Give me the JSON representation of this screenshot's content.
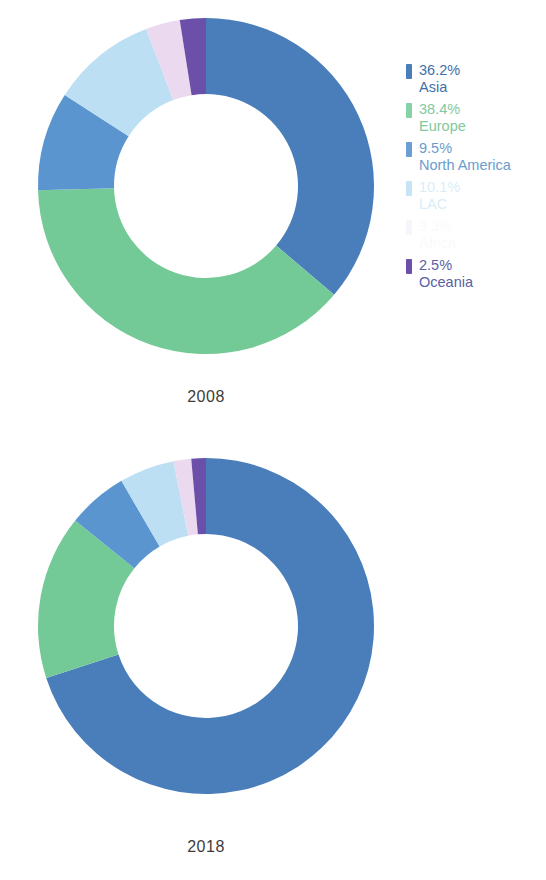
{
  "chart_data": [
    {
      "type": "pie",
      "title": "2008",
      "subtitle": "",
      "xlabel": "",
      "ylabel": "",
      "donut": true,
      "legend_position": "right",
      "grid": false,
      "categories": [
        "Asia",
        "Europe",
        "North America",
        "LAC",
        "Africa",
        "Oceania"
      ],
      "values": [
        36.2,
        38.4,
        9.5,
        10.1,
        3.3,
        2.5
      ],
      "labels": [
        "36.2%",
        "38.4%",
        "9.5%",
        "10.1%",
        "3.3%",
        "2.5%"
      ],
      "colors": [
        "#4a7ebb",
        "#73ca97",
        "#5b95d0",
        "#bcdff4",
        "#ead9ef",
        "#6b4fa8"
      ]
    },
    {
      "type": "pie",
      "title": "2018",
      "subtitle": "",
      "xlabel": "",
      "ylabel": "",
      "donut": true,
      "legend_position": "right",
      "grid": false,
      "categories": [
        "Asia",
        "Europe",
        "North America",
        "LAC",
        "Africa",
        "Oceania"
      ],
      "values": [
        70.0,
        15.8,
        5.8,
        5.3,
        1.7,
        1.4
      ],
      "labels": [
        "70.0%",
        "15.8%",
        "5.8%",
        "5.3%",
        "1.7%",
        "1.4%"
      ],
      "colors": [
        "#4a7ebb",
        "#73ca97",
        "#5b95d0",
        "#bcdff4",
        "#ead9ef",
        "#6b4fa8"
      ]
    }
  ],
  "charts": [
    {
      "year_label": "2008",
      "legend": [
        {
          "pct": "36.2%",
          "name": "Asia",
          "color": "#4a7ebb",
          "text_color": "#3f6fa8",
          "opacity": "1"
        },
        {
          "pct": "38.4%",
          "name": "Europe",
          "color": "#73ca97",
          "text_color": "#6cc08f",
          "opacity": "0.85"
        },
        {
          "pct": "9.5%",
          "name": "North America",
          "color": "#5b95d0",
          "text_color": "#5a93c9",
          "opacity": "0.9"
        },
        {
          "pct": "10.1%",
          "name": "LAC",
          "color": "#7fc5ea",
          "text_color": "#aed8ef",
          "opacity": "0.45"
        },
        {
          "pct": "3.3%",
          "name": "Africa",
          "color": "#d9c9e4",
          "text_color": "#e2e6ea",
          "opacity": "0.18"
        },
        {
          "pct": "2.5%",
          "name": "Oceania",
          "color": "#6b4fa8",
          "text_color": "#5a5fa5",
          "opacity": "1"
        }
      ]
    },
    {
      "year_label": "2018",
      "legend": [
        {
          "pct": "70.0%",
          "name": "Asia",
          "color": "#4a7ebb",
          "text_color": "#3f6fa8",
          "opacity": "1"
        },
        {
          "pct": "15.8%",
          "name": "Europe",
          "color": "#73ca97",
          "text_color": "#6cc08f",
          "opacity": "0.85"
        },
        {
          "pct": "5.8%",
          "name": "North America",
          "color": "#5b95d0",
          "text_color": "#5a93c9",
          "opacity": "0.9"
        },
        {
          "pct": "5.3%",
          "name": "LAC",
          "color": "#7fc5ea",
          "text_color": "#aed8ef",
          "opacity": "0.4"
        },
        {
          "pct": "1.7%",
          "name": "Africa",
          "color": "#d9c9e4",
          "text_color": "#e2e6ea",
          "opacity": "0.15"
        },
        {
          "pct": "1.4%",
          "name": "Oceania",
          "color": "#6b4fa8",
          "text_color": "#5a5fa5",
          "opacity": "1"
        }
      ]
    }
  ]
}
